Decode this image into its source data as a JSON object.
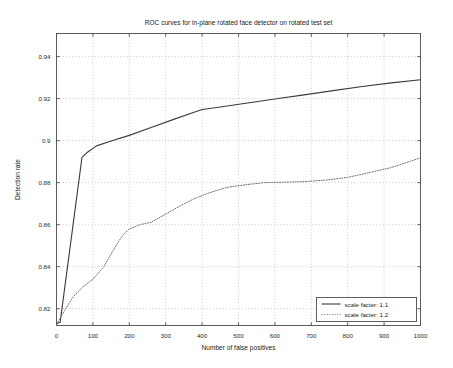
{
  "chart_data": {
    "type": "line",
    "title": "ROC curves for in-plane rotated face detector on rotated test set",
    "xlabel": "Number of false positives",
    "ylabel": "Detection rate",
    "xlim": [
      0,
      1000
    ],
    "ylim": [
      0.812,
      0.951
    ],
    "grid": true,
    "legend_position": "bottom-right",
    "xticks": [
      0,
      100,
      200,
      300,
      400,
      500,
      600,
      700,
      800,
      900,
      1000
    ],
    "xtick_labels": [
      "0",
      "100",
      "200",
      "300",
      "400",
      "500",
      "600",
      "700",
      "800",
      "900",
      "1000"
    ],
    "yticks": [
      0.82,
      0.84,
      0.86,
      0.88,
      0.9,
      0.92,
      0.94
    ],
    "ytick_labels": [
      "0.82",
      "0.84",
      "0.86",
      "0.88",
      "0.9",
      "0.92",
      "0.94"
    ],
    "series": [
      {
        "name": "scale facter: 1.1",
        "style": "solid",
        "color": "#3b3b3b",
        "x": [
          0,
          10,
          70,
          85,
          110,
          150,
          200,
          260,
          320,
          370,
          400,
          450,
          520,
          600,
          680,
          760,
          840,
          920,
          1000
        ],
        "y": [
          0.8128,
          0.8135,
          0.892,
          0.8945,
          0.8975,
          0.8998,
          0.9025,
          0.9063,
          0.91,
          0.913,
          0.9148,
          0.916,
          0.9178,
          0.9198,
          0.9218,
          0.9238,
          0.9258,
          0.9275,
          0.929
        ]
      },
      {
        "name": "scale facter: 1.2",
        "style": "dotted",
        "color": "#6a6a6a",
        "x": [
          0,
          20,
          45,
          70,
          100,
          130,
          160,
          180,
          200,
          230,
          260,
          300,
          340,
          380,
          420,
          470,
          520,
          570,
          620,
          680,
          740,
          800,
          860,
          920,
          1000
        ],
        "y": [
          0.8125,
          0.8185,
          0.8255,
          0.83,
          0.834,
          0.84,
          0.849,
          0.8545,
          0.858,
          0.86,
          0.8612,
          0.865,
          0.869,
          0.8725,
          0.8752,
          0.8778,
          0.879,
          0.88,
          0.8802,
          0.8805,
          0.8812,
          0.8825,
          0.8848,
          0.8872,
          0.8918
        ]
      }
    ]
  }
}
